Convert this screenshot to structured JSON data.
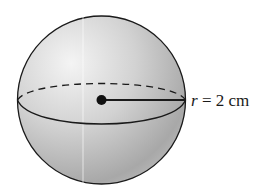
{
  "diagram": {
    "shape": "sphere",
    "radius_label": {
      "variable": "r",
      "equals": " = ",
      "value": "2 cm"
    }
  },
  "colors": {
    "outline": "#1a1a1a",
    "fill_light": "#eeeeee",
    "fill_dark": "#9a9a9a"
  }
}
